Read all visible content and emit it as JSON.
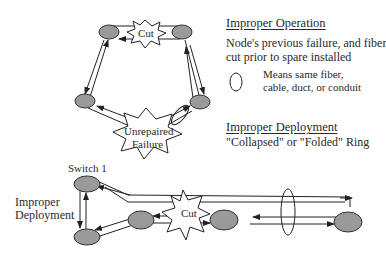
{
  "legend": {
    "improper_operation": {
      "heading": "Improper Operation",
      "line1": "Node's previous failure, and fiber",
      "line2": "cut prior to spare installed"
    },
    "ellipse_note": {
      "line1": "Means same fiber,",
      "line2": "cable, duct, or conduit"
    },
    "improper_deployment": {
      "heading": "Improper Deployment",
      "subtitle": "\"Collapsed\" or \"Folded\" Ring"
    }
  },
  "top_ring": {
    "cut_label": "Cut",
    "failure_label_line1": "Unrepaired",
    "failure_label_line2": "Failure"
  },
  "bottom_ring": {
    "switch_label": "Switch 1",
    "side_label_line1": "Improper",
    "side_label_line2": "Deployment",
    "cut_label": "Cut"
  },
  "colors": {
    "node_fill": "#9a9a9a",
    "line": "#222222",
    "background": "#ffffff"
  }
}
